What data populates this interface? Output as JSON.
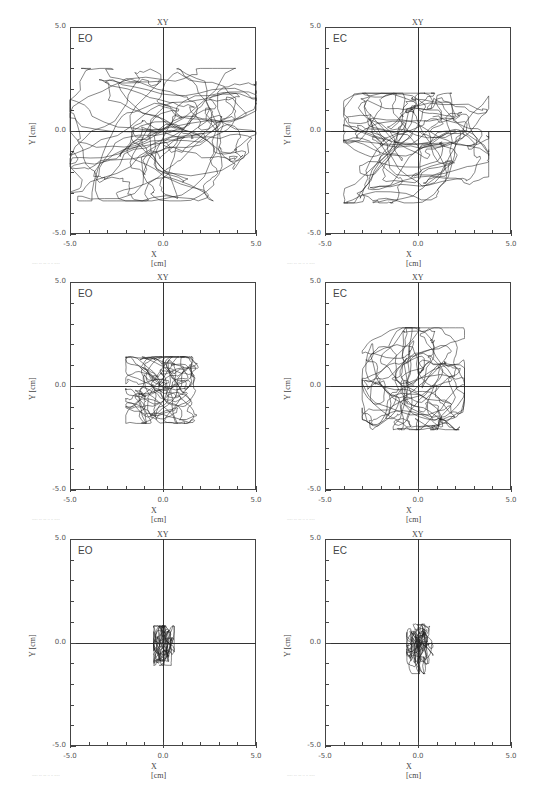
{
  "figure": {
    "x_ticks": [
      "-5.0",
      "0.0",
      "5.0"
    ],
    "y_ticks": [
      "5.0",
      "0.0",
      "-5.0"
    ],
    "xlabel": "X [cm]",
    "ylabel": "Y [cm]",
    "plot_title": "XY",
    "panels": [
      {
        "condition": "EO",
        "group": "",
        "footer": "·····  ··· ··· ·· ·· ·····"
      },
      {
        "condition": "EC",
        "group": "NPH BEFORE",
        "footer": "·····  ··· ··· ·· ·· ·····"
      },
      {
        "condition": "EO",
        "group": "",
        "footer": "·····  ··· ··· ·· ·· ·····"
      },
      {
        "condition": "EC",
        "group": "NPH AFTER",
        "footer": "·····  ··· ··· ·· ·· ·····"
      },
      {
        "condition": "EO",
        "group": "",
        "footer": "·····  ··· ··· ·· ·· ·····"
      },
      {
        "condition": "EC",
        "group": "CONTROL",
        "footer": "·····  ··· ··· ·· ·· ·····"
      }
    ]
  },
  "chart_data": [
    {
      "type": "scatter",
      "title": "XY",
      "subtitle": "EO",
      "group": "NPH BEFORE",
      "xlabel": "X [cm]",
      "ylabel": "Y [cm]",
      "xlim": [
        -5,
        5
      ],
      "ylim": [
        -5,
        5
      ],
      "x_ticks": [
        -5,
        0,
        5
      ],
      "y_ticks": [
        -5,
        0,
        5
      ],
      "minor_tick_step": 1,
      "description": "Center-of-pressure sway trace; wide spread x≈-5..5, y≈-3.5..3",
      "extent": {
        "x": [
          -5.0,
          5.0
        ],
        "y": [
          -3.4,
          3.0
        ]
      }
    },
    {
      "type": "scatter",
      "title": "XY",
      "subtitle": "EC",
      "group": "NPH BEFORE",
      "xlabel": "X [cm]",
      "ylabel": "Y [cm]",
      "xlim": [
        -5,
        5
      ],
      "ylim": [
        -5,
        5
      ],
      "x_ticks": [
        -5,
        0,
        5
      ],
      "y_ticks": [
        -5,
        0,
        5
      ],
      "minor_tick_step": 1,
      "description": "Sway trace; spread x≈-4..3.8, y≈-3.5..1.8",
      "extent": {
        "x": [
          -4.0,
          3.8
        ],
        "y": [
          -3.5,
          1.8
        ]
      }
    },
    {
      "type": "scatter",
      "title": "XY",
      "subtitle": "EO",
      "group": "NPH AFTER",
      "xlabel": "X [cm]",
      "ylabel": "Y [cm]",
      "xlim": [
        -5,
        5
      ],
      "ylim": [
        -5,
        5
      ],
      "x_ticks": [
        -5,
        0,
        5
      ],
      "y_ticks": [
        -5,
        0,
        5
      ],
      "minor_tick_step": 1,
      "description": "Sway trace; compact x≈-2..1.9, y≈-1.8..1.4",
      "extent": {
        "x": [
          -2.0,
          1.9
        ],
        "y": [
          -1.8,
          1.4
        ]
      }
    },
    {
      "type": "scatter",
      "title": "XY",
      "subtitle": "EC",
      "group": "NPH AFTER",
      "xlabel": "X [cm]",
      "ylabel": "Y [cm]",
      "xlim": [
        -5,
        5
      ],
      "ylim": [
        -5,
        5
      ],
      "x_ticks": [
        -5,
        0,
        5
      ],
      "y_ticks": [
        -5,
        0,
        5
      ],
      "minor_tick_step": 1,
      "description": "Sway trace; x≈-3..2.5, y≈-2.1..2.8",
      "extent": {
        "x": [
          -3.0,
          2.5
        ],
        "y": [
          -2.1,
          2.8
        ]
      }
    },
    {
      "type": "scatter",
      "title": "XY",
      "subtitle": "EO",
      "group": "CONTROL",
      "xlabel": "X [cm]",
      "ylabel": "Y [cm]",
      "xlim": [
        -5,
        5
      ],
      "ylim": [
        -5,
        5
      ],
      "x_ticks": [
        -5,
        0,
        5
      ],
      "y_ticks": [
        -5,
        0,
        5
      ],
      "minor_tick_step": 1,
      "description": "Sway trace; tight x≈-0.5..0.6, y≈-1.1..0.8",
      "extent": {
        "x": [
          -0.5,
          0.6
        ],
        "y": [
          -1.1,
          0.8
        ]
      }
    },
    {
      "type": "scatter",
      "title": "XY",
      "subtitle": "EC",
      "group": "CONTROL",
      "xlabel": "X [cm]",
      "ylabel": "Y [cm]",
      "xlim": [
        -5,
        5
      ],
      "ylim": [
        -5,
        5
      ],
      "x_ticks": [
        -5,
        0,
        5
      ],
      "y_ticks": [
        -5,
        0,
        5
      ],
      "minor_tick_step": 1,
      "description": "Sway trace; tight x≈-0.6..0.8, y≈-1.5..0.9",
      "extent": {
        "x": [
          -0.6,
          0.8
        ],
        "y": [
          -1.5,
          0.9
        ]
      }
    }
  ]
}
